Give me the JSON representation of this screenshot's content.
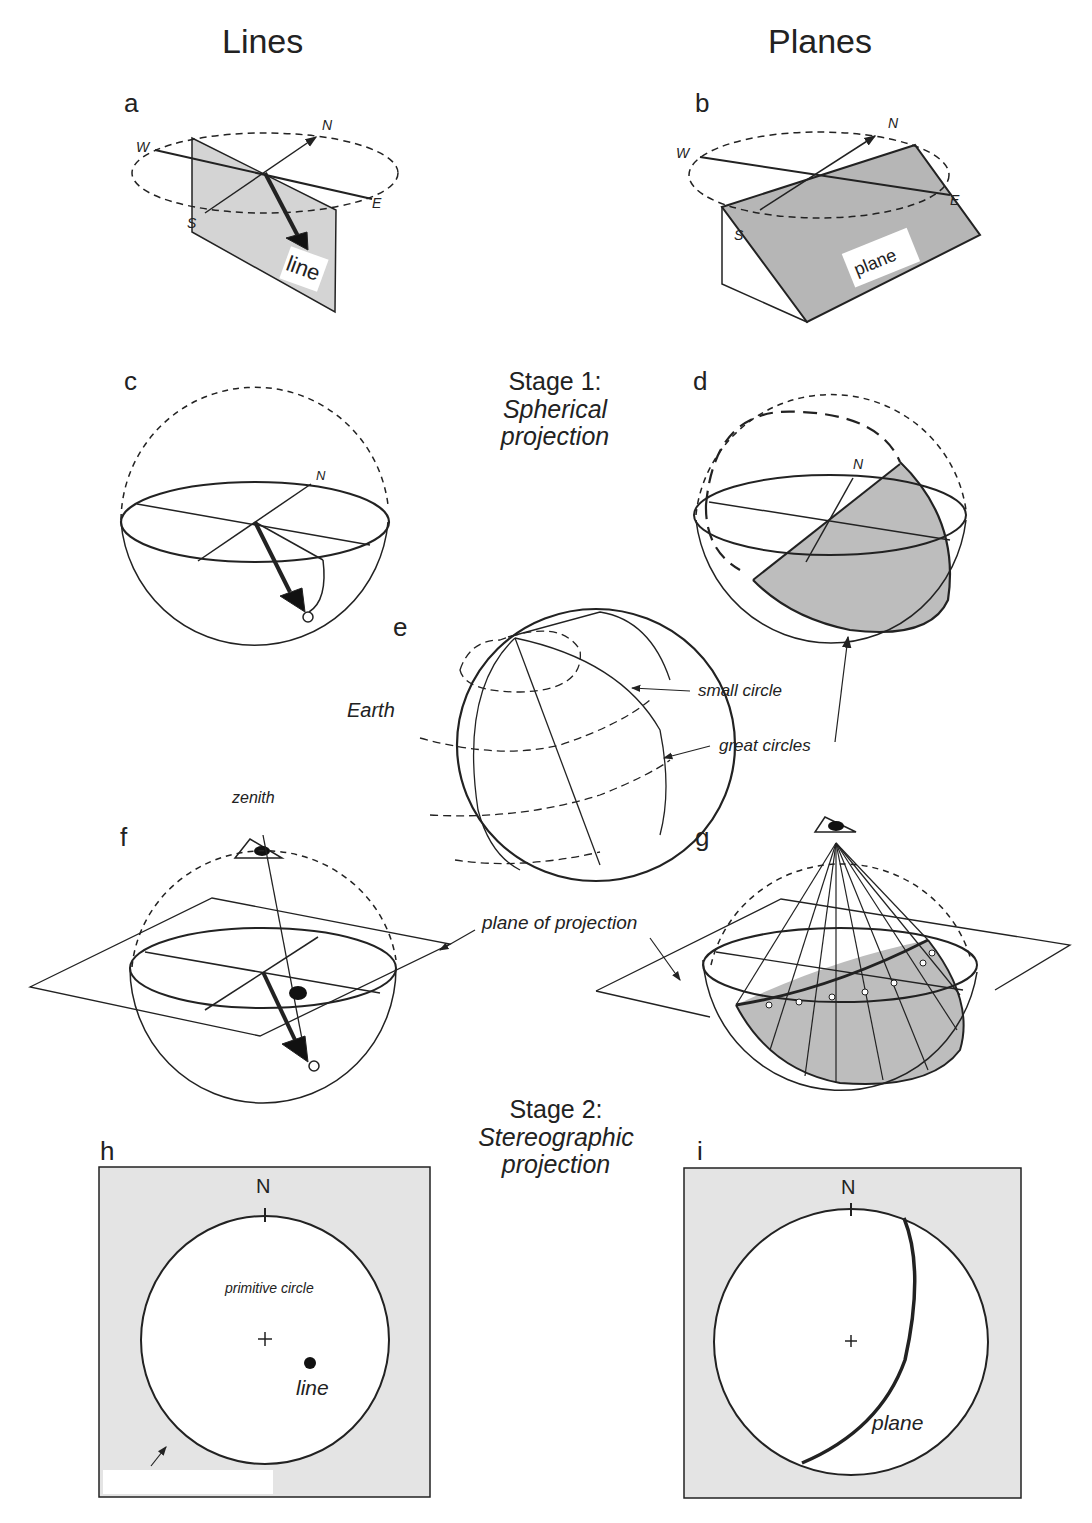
{
  "columns": {
    "left": "Lines",
    "right": "Planes"
  },
  "panels": {
    "a": {
      "letter": "a",
      "label": "line",
      "compass": [
        "N",
        "E",
        "S",
        "W"
      ]
    },
    "b": {
      "letter": "b",
      "label": "plane",
      "compass": [
        "N",
        "E",
        "S",
        "W"
      ]
    },
    "c": {
      "letter": "c",
      "compass": [
        "N"
      ]
    },
    "d": {
      "letter": "d",
      "compass": [
        "N"
      ]
    },
    "e": {
      "letter": "e",
      "earth": "Earth",
      "small_circle": "small circle",
      "great_circles": "great circles"
    },
    "f": {
      "letter": "f",
      "zenith": "zenith",
      "plane_of_projection": "plane of projection"
    },
    "g": {
      "letter": "g"
    },
    "h": {
      "letter": "h",
      "north": "N",
      "primitive_circle": "primitive circle",
      "line": "line",
      "center": "+"
    },
    "i": {
      "letter": "i",
      "north": "N",
      "plane": "plane",
      "center": "+"
    }
  },
  "stages": {
    "stage1": {
      "title": "Stage 1:",
      "subtitle_1": "Spherical",
      "subtitle_2": "projection"
    },
    "stage2": {
      "title": "Stage 2:",
      "subtitle_1": "Stereographic",
      "subtitle_2": "projection"
    }
  },
  "colors": {
    "shade": "#c8c8c8",
    "panel_bg": "#e4e4e4",
    "ink": "#222222"
  }
}
